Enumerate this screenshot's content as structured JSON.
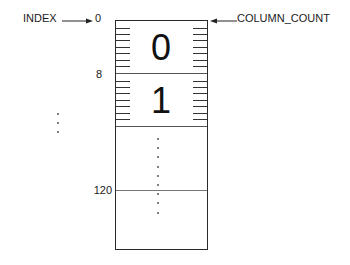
{
  "diagram": {
    "type": "memory-layout",
    "labels": {
      "index": "INDEX",
      "column_count": "COLUMN_COUNT"
    },
    "offsets": {
      "start": "0",
      "second": "8",
      "last": "120"
    },
    "cells": [
      {
        "value": "0"
      },
      {
        "value": "1"
      }
    ],
    "colors": {
      "stroke": "#2a2a2a",
      "text": "#1a1a1a",
      "background": "#ffffff"
    }
  }
}
